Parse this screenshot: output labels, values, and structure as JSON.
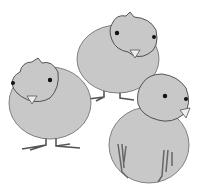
{
  "image": {
    "subject": "Three cartoon chicks",
    "chicks": [
      {
        "id": "back-center",
        "pose": "facing right"
      },
      {
        "id": "front-left",
        "pose": "facing forward"
      },
      {
        "id": "front-right",
        "pose": "facing right, seen from back"
      }
    ],
    "colors": {
      "body": "#c8c8c8",
      "outline": "#555555",
      "eye": "#111111",
      "beak": "#e8e8e8",
      "feet": "#777777",
      "background": "#ffffff"
    }
  }
}
